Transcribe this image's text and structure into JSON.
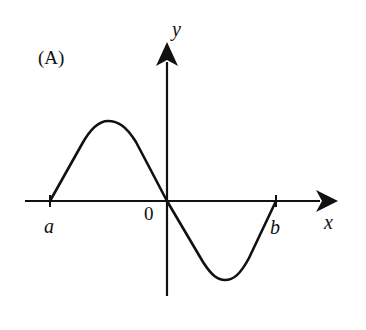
{
  "figure": {
    "panel_label": "(A)",
    "axes": {
      "x_label": "x",
      "y_label": "y",
      "origin_label": "0"
    },
    "points": {
      "a_label": "a",
      "b_label": "b"
    },
    "colors": {
      "stroke": "#111111",
      "background": "#ffffff"
    }
  }
}
